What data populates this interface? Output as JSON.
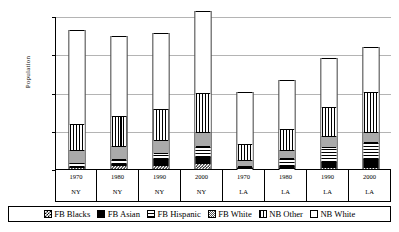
{
  "chart_data": {
    "type": "bar",
    "subtype": "stacked-bar",
    "title": "",
    "xlabel": "",
    "ylabel": "Population",
    "ylim": [
      0,
      20000000
    ],
    "yticks": [
      0,
      5000000,
      10000000,
      15000000,
      20000000
    ],
    "ytick_labels": [
      "0",
      "5,000,000",
      "10,000,000",
      "15,000,000",
      "20,000,000"
    ],
    "grid": true,
    "legend_position": "bottom",
    "categories": [
      "1970",
      "1980",
      "1990",
      "2000",
      "1970",
      "1980",
      "1990",
      "2000"
    ],
    "category_groups": [
      "NY",
      "NY",
      "NY",
      "NY",
      "LA",
      "LA",
      "LA",
      "LA"
    ],
    "series": [
      {
        "name": "FB Blacks",
        "pattern": "checkerboard",
        "values": [
          190000,
          330000,
          450000,
          600000,
          30000,
          60000,
          110000,
          160000
        ]
      },
      {
        "name": "FB Asian",
        "pattern": "solid-black",
        "values": [
          120000,
          300000,
          800000,
          1000000,
          60000,
          290000,
          750000,
          1100000
        ]
      },
      {
        "name": "FB Hispanic",
        "pattern": "horizontal-lines",
        "values": [
          450000,
          700000,
          900000,
          1400000,
          280000,
          1100000,
          2000000,
          2300000
        ]
      },
      {
        "name": "FB White",
        "pattern": "fine-checker",
        "values": [
          1750000,
          1700000,
          1650000,
          1900000,
          750000,
          1000000,
          1400000,
          1300000
        ]
      },
      {
        "name": "NB Other",
        "pattern": "vertical-lines",
        "values": [
          3350000,
          3850000,
          4100000,
          5000000,
          2100000,
          2750000,
          3800000,
          5200000
        ]
      },
      {
        "name": "NB White",
        "pattern": "white",
        "values": [
          12340000,
          10520000,
          9900000,
          10700000,
          6880000,
          6400000,
          6440000,
          5940000
        ]
      }
    ],
    "totals": [
      18200000,
      17400000,
      17800000,
      20600000,
      10100000,
      11600000,
      14500000,
      16000000
    ]
  },
  "axes": {
    "y_label": "Population",
    "y_ticks": [
      {
        "label": "20,000,000",
        "value": 20000000
      },
      {
        "label": "15,000,000",
        "value": 15000000
      },
      {
        "label": "10,000,000",
        "value": 10000000
      },
      {
        "label": "5,000,000",
        "value": 5000000
      },
      {
        "label": "0",
        "value": 0
      }
    ],
    "x_cells": [
      {
        "year": "1970",
        "place": "NY"
      },
      {
        "year": "1980",
        "place": "NY"
      },
      {
        "year": "1990",
        "place": "NY"
      },
      {
        "year": "2000",
        "place": "NY"
      },
      {
        "year": "1970",
        "place": "LA"
      },
      {
        "year": "1980",
        "place": "LA"
      },
      {
        "year": "1990",
        "place": "LA"
      },
      {
        "year": "2000",
        "place": "LA"
      }
    ]
  },
  "legend": {
    "items": [
      {
        "label": "FB Blacks",
        "swatch": "checkerboard-swatch"
      },
      {
        "label": "FB Asian",
        "swatch": "solid-black-swatch"
      },
      {
        "label": "FB Hispanic",
        "swatch": "horizontal-lines-swatch"
      },
      {
        "label": "FB White",
        "swatch": "fine-checker-swatch"
      },
      {
        "label": "NB Other",
        "swatch": "vertical-lines-swatch"
      },
      {
        "label": "NB White",
        "swatch": "white-swatch"
      }
    ]
  },
  "colors": {
    "ink": "#000000",
    "gridline": "#b4b4b4",
    "background": "#ffffff"
  }
}
